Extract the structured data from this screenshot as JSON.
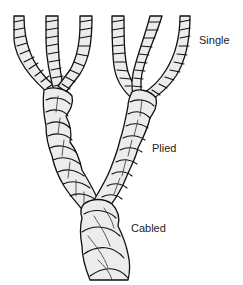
{
  "diagram": {
    "type": "yarn-structure-illustration",
    "labels": {
      "single": "Single",
      "plied": "Plied",
      "cabled": "Cabled"
    },
    "stages": [
      {
        "name": "Single",
        "description": "six individual strands at top, in two groups of three"
      },
      {
        "name": "Plied",
        "description": "each group of three singles twisted into one plied yarn"
      },
      {
        "name": "Cabled",
        "description": "two plied yarns twisted together into a cable"
      }
    ],
    "colors": {
      "outline": "#111111",
      "fill": "#ececec",
      "background": "#ffffff",
      "text": "#222222"
    }
  }
}
